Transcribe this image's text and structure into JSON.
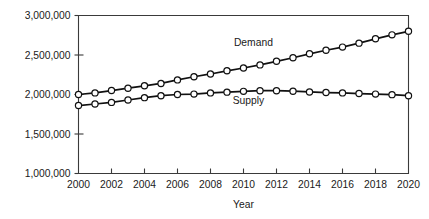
{
  "chart_data": {
    "type": "line",
    "title": "",
    "xlabel": "Year",
    "ylabel": "",
    "grid": false,
    "legend_position": "inline-annotation",
    "x": [
      2000,
      2001,
      2002,
      2003,
      2004,
      2005,
      2006,
      2007,
      2008,
      2009,
      2010,
      2011,
      2012,
      2013,
      2014,
      2015,
      2016,
      2017,
      2018,
      2019,
      2020
    ],
    "xlim": [
      2000,
      2020
    ],
    "ylim": [
      1000000,
      3000000
    ],
    "xticks": [
      2000,
      2002,
      2004,
      2006,
      2008,
      2010,
      2012,
      2014,
      2016,
      2018,
      2020
    ],
    "xtick_labels": [
      "2000",
      "2002",
      "2004",
      "2006",
      "2008",
      "2010",
      "2012",
      "2014",
      "2016",
      "2018",
      "2020"
    ],
    "yticks": [
      1000000,
      1500000,
      2000000,
      2500000,
      3000000
    ],
    "ytick_labels": [
      "1,000,000",
      "1,500,000",
      "2,000,000",
      "2,500,000",
      "3,000,000"
    ],
    "series": [
      {
        "name": "Demand",
        "label": "Demand",
        "label_x": 2010.6,
        "label_y": 2620000,
        "marker": "open-circle",
        "color": "#111111",
        "values": [
          2000000,
          2020000,
          2050000,
          2080000,
          2110000,
          2140000,
          2185000,
          2225000,
          2260000,
          2300000,
          2335000,
          2375000,
          2420000,
          2465000,
          2515000,
          2560000,
          2600000,
          2650000,
          2705000,
          2755000,
          2800000
        ]
      },
      {
        "name": "Supply",
        "label": "Supply",
        "label_x": 2010.3,
        "label_y": 1880000,
        "marker": "open-circle",
        "color": "#111111",
        "values": [
          1860000,
          1880000,
          1900000,
          1930000,
          1960000,
          1985000,
          2000000,
          2005000,
          2020000,
          2030000,
          2040000,
          2048000,
          2048000,
          2042000,
          2032000,
          2025000,
          2020000,
          2012000,
          2005000,
          1998000,
          1985000
        ]
      }
    ]
  }
}
